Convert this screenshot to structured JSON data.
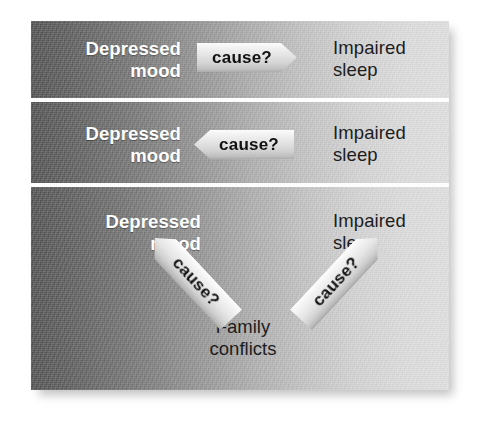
{
  "figure": {
    "kind": "causal-direction-diagram",
    "background_color": "#ffffff",
    "panel_gradient_from": "#4e4e4e",
    "panel_gradient_to": "#dddddd",
    "divider_color": "#ffffff"
  },
  "panels": [
    {
      "id": "panel-1",
      "left_label": "Depressed\nmood",
      "right_label": "Impaired\nsleep",
      "arrows": [
        {
          "label": "cause?",
          "direction": "right"
        }
      ]
    },
    {
      "id": "panel-2",
      "left_label": "Depressed\nmood",
      "right_label": "Impaired\nsleep",
      "arrows": [
        {
          "label": "cause?",
          "direction": "left"
        }
      ]
    },
    {
      "id": "panel-3",
      "left_label": "Depressed\nmood",
      "right_label": "Impaired\nsleep",
      "center_label": "Family\nconflicts",
      "arrows": [
        {
          "label": "cause?",
          "direction": "down-right"
        },
        {
          "label": "cause?",
          "direction": "up-right"
        }
      ]
    }
  ],
  "text_colors": {
    "left_label": "#ffffff",
    "right_label": "#1d1d1d",
    "center_label": "#1d1d1d",
    "arrow_label": "#111111"
  }
}
